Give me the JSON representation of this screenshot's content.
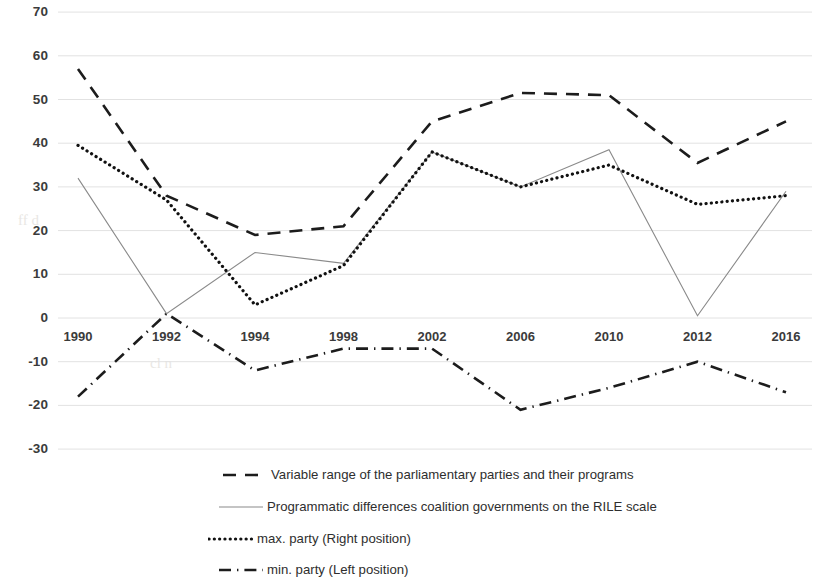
{
  "chart_data": {
    "type": "line",
    "title": "",
    "subtitle": "",
    "xlabel": "",
    "ylabel": "",
    "x": [
      "1990",
      "1992",
      "1994",
      "1998",
      "2002",
      "2006",
      "2010",
      "2012",
      "2016"
    ],
    "categories": [
      "1990",
      "1992",
      "1994",
      "1998",
      "2002",
      "2006",
      "2010",
      "2012",
      "2016"
    ],
    "xtick_labels": [
      "1990",
      "1992",
      "1994",
      "1998",
      "2002",
      "2006",
      "2010",
      "2012",
      "2016"
    ],
    "ytick_labels": [
      "70",
      "60",
      "50",
      "40",
      "30",
      "20",
      "10",
      "0",
      "-10",
      "-20",
      "-30"
    ],
    "ytick_values": [
      70,
      60,
      50,
      40,
      30,
      20,
      10,
      0,
      -10,
      -20,
      -30
    ],
    "ylim": [
      -30,
      70
    ],
    "grid": "horizontal",
    "legend_position": "bottom",
    "series": [
      {
        "name": "Variable range of the parliamentary parties and their programs",
        "style": "dashed",
        "color": "#1c1c1c",
        "values": [
          57,
          28,
          19,
          21,
          45,
          51.5,
          51,
          35.5,
          45
        ]
      },
      {
        "name": "Programmatic differences coalition governments on the RILE scale",
        "style": "solid",
        "color": "#8a8a8a",
        "values": [
          32,
          1,
          15,
          12.5,
          38,
          30,
          38.5,
          0.5,
          29
        ]
      },
      {
        "name": "max. party (Right position)",
        "style": "dotted",
        "color": "#111111",
        "values": [
          39.5,
          27,
          3,
          12,
          38,
          30,
          35,
          26,
          28
        ]
      },
      {
        "name": "min. party (Left position)",
        "style": "dashdot",
        "color": "#1c1c1c",
        "values": [
          -18,
          1,
          -12,
          -7,
          -7,
          -21,
          -16,
          -10,
          -17
        ]
      }
    ]
  },
  "legend": {
    "items": [
      {
        "swatch": "dashed-line-swatch",
        "label": "Variable range of the parliamentary parties and their programs"
      },
      {
        "swatch": "solid-line-swatch",
        "label": "Programmatic differences coalition governments on the RILE scale"
      },
      {
        "swatch": "dotted-line-swatch",
        "label": "max. party (Right position)"
      },
      {
        "swatch": "dashdot-line-swatch",
        "label": "min. party (Left position)"
      }
    ]
  }
}
